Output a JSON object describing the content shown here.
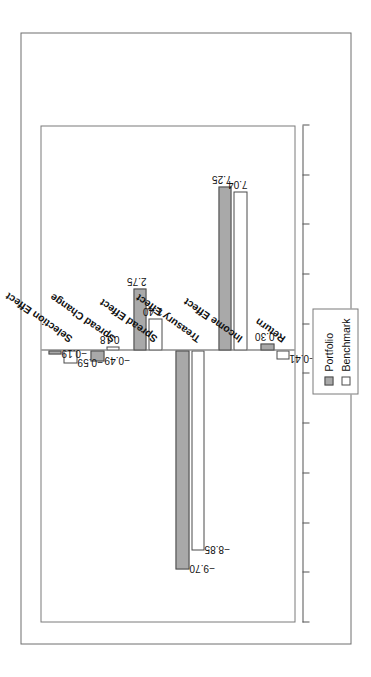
{
  "chart_data": {
    "type": "bar",
    "title": "Contributors to the Return",
    "xlabel": "",
    "ylabel": "",
    "orientation": "rotated-90-ccw",
    "grid": false,
    "legend_position": "top-right-of-plot",
    "categories": [
      "Return",
      "Income Effect",
      "Treasury Effect",
      "Spread Effect",
      "Spread Change",
      "Selection Effect"
    ],
    "series": [
      {
        "name": "Portfolio",
        "color": "#a9a9a9",
        "values": [
          0.3,
          7.25,
          -9.7,
          2.75,
          -0.49,
          -0.19
        ]
      },
      {
        "name": "Benchmark",
        "color": "#ffffff",
        "values": [
          -0.41,
          7.04,
          -8.85,
          1.4,
          0.18,
          -0.59
        ]
      }
    ],
    "value_labels": {
      "Return": {
        "Portfolio": "0.30",
        "Benchmark": "−0.41"
      },
      "Income Effect": {
        "Portfolio": "7.25",
        "Benchmark": "7.04"
      },
      "Treasury Effect": {
        "Portfolio": "−9.70",
        "Benchmark": "−8.85"
      },
      "Spread Effect": {
        "Portfolio": "2.75",
        "Benchmark": "1.40"
      },
      "Spread Change": {
        "Portfolio": "−0.49",
        "Benchmark": "0.18"
      },
      "Selection Effect": {
        "Portfolio": "−0.19",
        "Benchmark": "−0.59"
      }
    },
    "ylim": [
      -12,
      10
    ],
    "tick_count": 11
  },
  "figure": {
    "title": "Contributors to the Return"
  },
  "legend": {
    "items": [
      {
        "label": "Portfolio",
        "swatch": "filled-gray"
      },
      {
        "label": "Benchmark",
        "swatch": "empty-white"
      }
    ]
  }
}
